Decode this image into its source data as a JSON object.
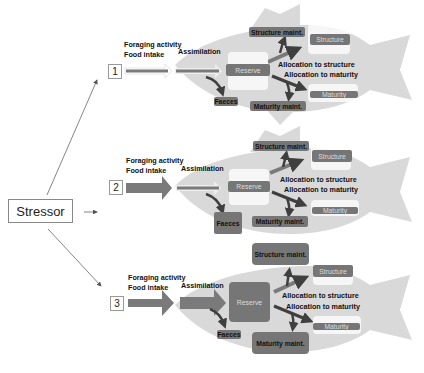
{
  "stressor": {
    "label": "Stressor"
  },
  "colors": {
    "fish": "#d9d9d9",
    "box": "#767676",
    "arrow": "#7a7a7a",
    "arrow_dark": "#3f3f3f"
  },
  "scenarios": [
    {
      "number": "1",
      "foraging": "Foraging activity",
      "food_intake": "Food intake",
      "assimilation": "Assimilation",
      "reserve": "Reserve",
      "faeces": "Faeces",
      "structure_maint": "Structure maint.",
      "structure": "Structure",
      "alloc_structure": "Allocation to structure",
      "alloc_maturity": "Allocation to maturity",
      "maturity": "Maturity",
      "maturity_maint": "Maturity maint."
    },
    {
      "number": "2",
      "foraging": "Foraging activity",
      "food_intake": "Food intake",
      "assimilation": "Assimilation",
      "reserve": "Reserve",
      "faeces": "Faeces",
      "structure_maint": "Structure maint.",
      "structure": "Structure",
      "alloc_structure": "Allocation to structure",
      "alloc_maturity": "Allocation to maturity",
      "maturity": "Maturity",
      "maturity_maint": "Maturity maint."
    },
    {
      "number": "3",
      "foraging": "Foraging activity",
      "food_intake": "Food intake",
      "assimilation": "Assimilation",
      "reserve": "Reserve",
      "faeces": "Faeces",
      "structure_maint": "Structure maint.",
      "structure": "Structure",
      "alloc_structure": "Allocation to structure",
      "alloc_maturity": "Allocation to maturity",
      "maturity": "Maturity",
      "maturity_maint": "Maturity maint."
    }
  ]
}
